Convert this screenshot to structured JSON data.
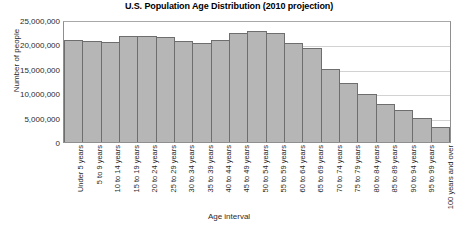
{
  "chart_data": {
    "type": "bar",
    "title": "U.S. Population Age Distribution (2010 projection)",
    "xlabel": "Age interval",
    "ylabel": "Number of people",
    "ylim": [
      0,
      25000000
    ],
    "ytick_labels": [
      "25,000,000",
      "20,000,000",
      "15,000,000",
      "10,000,000",
      "5,000,000",
      "0"
    ],
    "ytick_values": [
      25000000,
      20000000,
      15000000,
      10000000,
      5000000,
      0
    ],
    "grid": true,
    "legend": false,
    "bar_color": "#b6b6b6",
    "bar_border_color": "#6e6e6e",
    "categories": [
      "Under 5 years",
      "5 to 9 years",
      "10 to 14 years",
      "15 to 19 years",
      "20 to 24 years",
      "25 to 29 years",
      "30 to 34 years",
      "35 to 39 years",
      "40 to 44 years",
      "45 to 49 years",
      "50 to 54 years",
      "55 to 59 years",
      "60 to 64 years",
      "65 to 69 years",
      "70 to 74 years",
      "75 to 79 years",
      "80 to 84 years",
      "85 to 89 years",
      "90 to 94 years",
      "95 to 99 years",
      "100 years and over"
    ],
    "values": [
      21000000,
      20800000,
      20400000,
      21800000,
      21800000,
      21500000,
      20700000,
      20300000,
      21000000,
      22300000,
      22800000,
      22400000,
      20300000,
      19200000,
      15000000,
      12000000,
      9800000,
      7800000,
      6600000,
      5000000,
      3000000
    ]
  }
}
